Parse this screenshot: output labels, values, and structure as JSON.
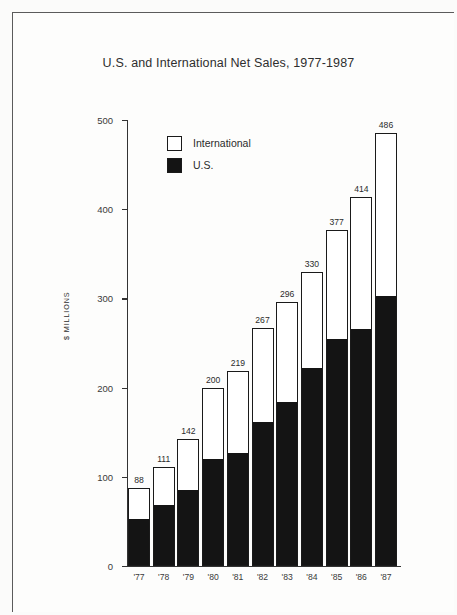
{
  "chart_data": {
    "type": "bar",
    "subtype": "stacked-vertical",
    "title": "U.S. and International Net Sales, 1977-1987",
    "xlabel": "",
    "ylabel": "$ MILLIONS",
    "ylim": [
      0,
      500
    ],
    "yticks": [
      0,
      100,
      200,
      300,
      400,
      500
    ],
    "ytick_labels": [
      "0",
      "100",
      "200",
      "300",
      "400",
      "500"
    ],
    "grid": false,
    "legend_position": "upper-left-inside",
    "categories": [
      "'77",
      "'78",
      "'79",
      "'80",
      "'81",
      "'82",
      "'83",
      "'84",
      "'85",
      "'86",
      "'87"
    ],
    "totals": [
      88,
      111,
      142,
      200,
      219,
      267,
      296,
      330,
      377,
      414,
      486
    ],
    "total_labels": [
      "88",
      "111",
      "142",
      "200",
      "219",
      "267",
      "296",
      "330",
      "377",
      "414",
      "486"
    ],
    "series": [
      {
        "name": "U.S.",
        "color": "#141414",
        "stack_order": "bottom",
        "values": [
          53,
          68,
          85,
          120,
          127,
          162,
          184,
          222,
          255,
          266,
          303
        ]
      },
      {
        "name": "International",
        "color": "#ffffff",
        "stack_order": "top",
        "values": [
          35,
          43,
          57,
          80,
          92,
          105,
          112,
          108,
          122,
          148,
          183
        ]
      }
    ]
  },
  "legend": {
    "entries": [
      {
        "label": "International",
        "swatch": "white-square-icon"
      },
      {
        "label": "U.S.",
        "swatch": "black-square-icon"
      }
    ]
  }
}
